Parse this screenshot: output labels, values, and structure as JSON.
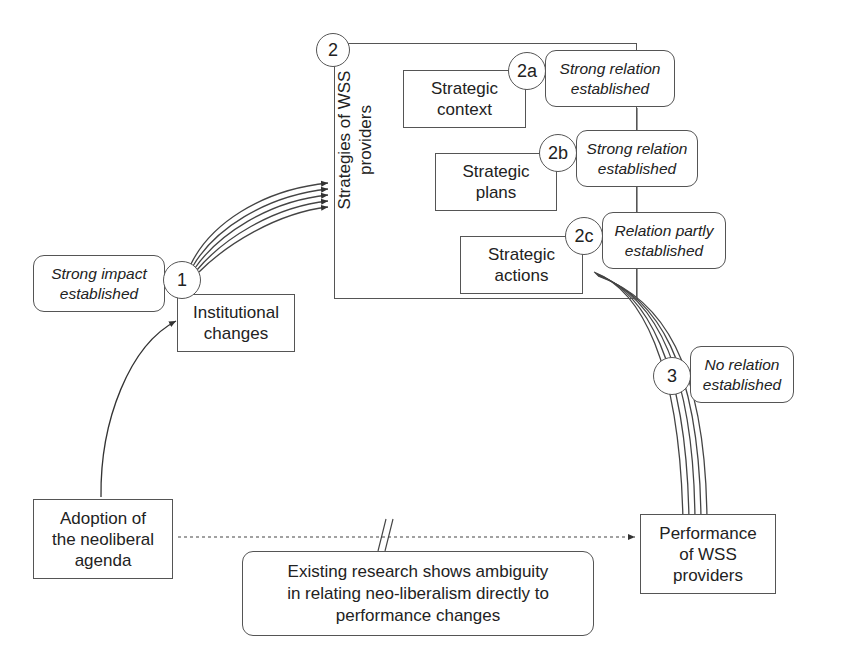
{
  "diagram": {
    "top_cutoff_text": "",
    "outer_box": {
      "number": "2",
      "label_line1": "Strategies of WSS",
      "label_line2": "providers"
    },
    "nodes": {
      "institutional_changes": {
        "number": "1",
        "line1": "Institutional",
        "line2": "changes"
      },
      "strategic_context": {
        "number": "2a",
        "line1": "Strategic",
        "line2": "context"
      },
      "strategic_plans": {
        "number": "2b",
        "line1": "Strategic",
        "line2": "plans"
      },
      "strategic_actions": {
        "number": "2c",
        "line1": "Strategic",
        "line2": "actions"
      },
      "adoption": {
        "line1": "Adoption of",
        "line2": "the neoliberal",
        "line3": "agenda"
      },
      "performance": {
        "number": "3",
        "line1": "Performance",
        "line2": "of WSS",
        "line3": "providers"
      }
    },
    "notes": {
      "n1": {
        "line1": "Strong impact",
        "line2": "established"
      },
      "n2a": {
        "line1": "Strong relation",
        "line2": "established"
      },
      "n2b": {
        "line1": "Strong relation",
        "line2": "established"
      },
      "n2c": {
        "line1": "Relation partly",
        "line2": "established"
      },
      "n3": {
        "line1": "No relation",
        "line2": "established"
      },
      "ambiguity": {
        "line1": "Existing research shows ambiguity",
        "line2": "in relating neo-liberalism directly to",
        "line3": "performance changes"
      }
    },
    "colors": {
      "line": "#444444",
      "border": "#555555",
      "background": "#ffffff"
    }
  }
}
